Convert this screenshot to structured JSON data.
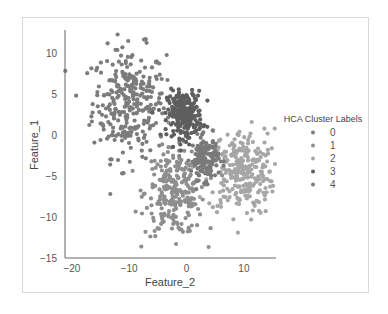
{
  "chart_data": {
    "type": "scatter",
    "title": "",
    "xlabel": "Feature_2",
    "ylabel": "Feature_1",
    "xlim": [
      -21.2,
      15.6
    ],
    "ylim": [
      -15,
      12.8
    ],
    "xticks": [
      -20,
      -10,
      0,
      10
    ],
    "yticks": [
      10,
      5,
      0,
      -5,
      -10,
      -15
    ],
    "grid": false,
    "legend": {
      "title": "HCA Cluster Labels",
      "position": "right",
      "entries": [
        "0",
        "1",
        "2",
        "3",
        "4"
      ]
    },
    "series": [
      {
        "name": "0",
        "color": "#7c7c7c",
        "center": [
          -10,
          4
        ],
        "spread": [
          3.2,
          3.3
        ],
        "n": 300
      },
      {
        "name": "1",
        "color": "#8e8e8e",
        "center": [
          -2,
          -7
        ],
        "spread": [
          2.6,
          2.6
        ],
        "n": 260
      },
      {
        "name": "2",
        "color": "#a6a6a6",
        "center": [
          9.5,
          -4.5
        ],
        "spread": [
          2.9,
          2.6
        ],
        "n": 280
      },
      {
        "name": "3",
        "color": "#5e5e5e",
        "center": [
          -0.3,
          2.5
        ],
        "spread": [
          1.5,
          1.4
        ],
        "n": 260
      },
      {
        "name": "4",
        "color": "#7a7a7a",
        "center": [
          3.2,
          -2.8
        ],
        "spread": [
          1.2,
          1.3
        ],
        "n": 150
      }
    ]
  }
}
